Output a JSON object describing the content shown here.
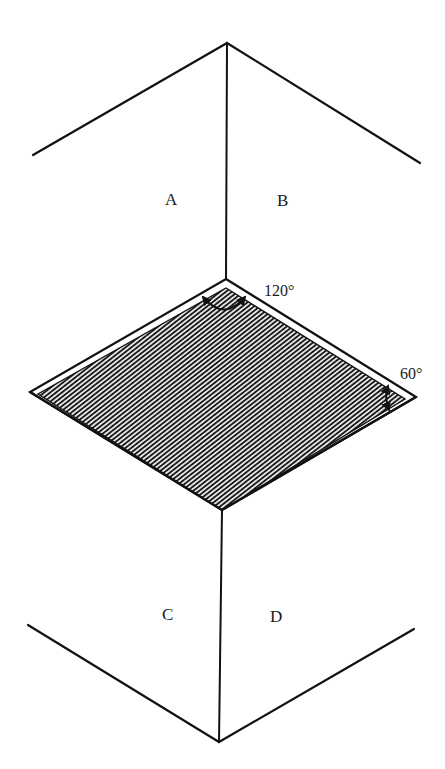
{
  "diagram": {
    "type": "isometric-corner-plane",
    "colors": {
      "stroke": "#111111",
      "background": "#ffffff",
      "hatch": "#1a1a1a"
    },
    "regions": [
      {
        "id": "A",
        "label": "A"
      },
      {
        "id": "B",
        "label": "B"
      },
      {
        "id": "C",
        "label": "C"
      },
      {
        "id": "D",
        "label": "D"
      }
    ],
    "angles": {
      "top": {
        "label": "120°"
      },
      "right": {
        "label": "60°"
      }
    },
    "shaded_plane": {
      "description": "hatched rhombus plane"
    }
  }
}
